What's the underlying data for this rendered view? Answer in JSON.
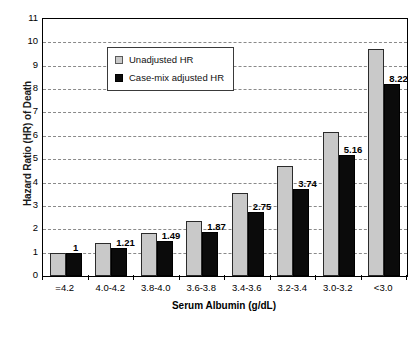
{
  "chart_data": {
    "type": "bar",
    "title": "",
    "xlabel": "Serum Albumin (g/dL)",
    "ylabel": "Hazard Ratio (HR) of Death",
    "categories": [
      "=4.2",
      "4.0-4.2",
      "3.8-4.0",
      "3.6-3.8",
      "3.4-3.6",
      "3.2-3.4",
      "3.0-3.2",
      "<3.0"
    ],
    "series": [
      {
        "name": "Unadjusted HR",
        "color": "#c9c9c9",
        "values": [
          1.0,
          1.42,
          1.85,
          2.37,
          3.55,
          4.73,
          6.15,
          9.7
        ],
        "labels": [
          "",
          "",
          "",
          "",
          "",
          "",
          "",
          ""
        ]
      },
      {
        "name": "Case-mix adjusted HR",
        "color": "#0b0b0b",
        "values": [
          1.0,
          1.21,
          1.49,
          1.87,
          2.75,
          3.74,
          5.16,
          8.22
        ],
        "labels": [
          "1",
          "1.21",
          "1.49",
          "1.87",
          "2.75",
          "3.74",
          "5.16",
          "8.22"
        ]
      }
    ],
    "ylim": [
      0,
      11
    ],
    "yticks": [
      0,
      1,
      2,
      3,
      4,
      5,
      6,
      7,
      8,
      9,
      10,
      11
    ],
    "ytick_labels": [
      "0",
      "1",
      "2",
      "3",
      "4",
      "5",
      "6",
      "7",
      "8",
      "9",
      "10",
      "11"
    ],
    "grid": true,
    "grid_style": "dashed-horizontal",
    "legend_position": "top-left-inside"
  },
  "legend": {
    "entries": [
      {
        "label": "Unadjusted HR",
        "swatch": "light-gray"
      },
      {
        "label": "Case-mix adjusted HR",
        "swatch": "black"
      }
    ]
  },
  "axes": {
    "x_title": "Serum Albumin (g/dL)",
    "y_title": "Hazard Ratio (HR) of Death"
  }
}
